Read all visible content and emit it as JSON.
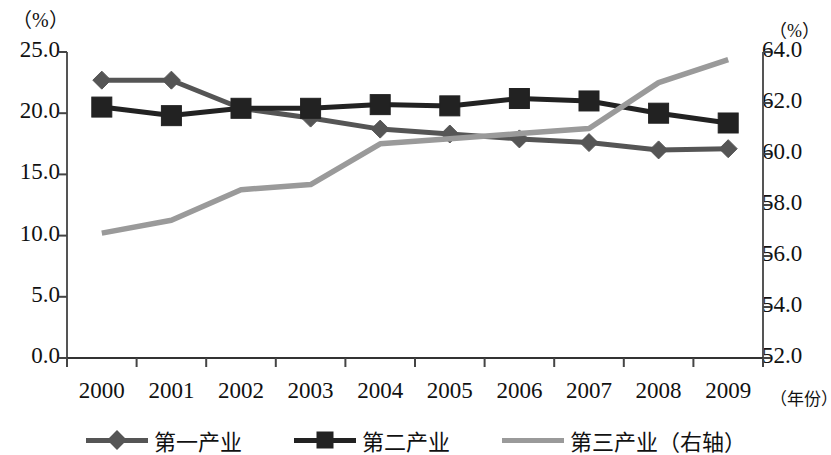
{
  "chart_data": {
    "type": "line",
    "title": "",
    "xlabel": "（年份）",
    "ylabel": "（%）",
    "y2label": "（%）",
    "grid": false,
    "legend_position": "bottom",
    "categories": [
      "2000",
      "2001",
      "2002",
      "2003",
      "2004",
      "2005",
      "2006",
      "2007",
      "2008",
      "2009"
    ],
    "x": [
      2000,
      2001,
      2002,
      2003,
      2004,
      2005,
      2006,
      2007,
      2008,
      2009
    ],
    "ylim": [
      0.0,
      25.0
    ],
    "y_ticks": [
      "0.0",
      "5.0",
      "10.0",
      "15.0",
      "20.0",
      "25.0"
    ],
    "y_tick_values": [
      0.0,
      5.0,
      10.0,
      15.0,
      20.0,
      25.0
    ],
    "y2lim": [
      52.0,
      64.0
    ],
    "y2_ticks": [
      "52.0",
      "54.0",
      "56.0",
      "58.0",
      "60.0",
      "62.0",
      "64.0"
    ],
    "y2_tick_values": [
      52.0,
      54.0,
      56.0,
      58.0,
      60.0,
      62.0,
      64.0
    ],
    "series": [
      {
        "name": "第一产业",
        "axis": "left",
        "marker": "diamond",
        "color": "#555555",
        "values": [
          22.7,
          22.7,
          20.4,
          19.6,
          18.7,
          18.3,
          17.9,
          17.6,
          17.0,
          17.1
        ]
      },
      {
        "name": "第二产业",
        "axis": "left",
        "marker": "square",
        "color": "#222222",
        "values": [
          20.5,
          19.8,
          20.4,
          20.4,
          20.7,
          20.6,
          21.2,
          21.0,
          20.0,
          19.2
        ]
      },
      {
        "name": "第三产业（右轴）",
        "axis": "right",
        "marker": "none",
        "color": "#9a9a9a",
        "values": [
          56.9,
          57.4,
          58.6,
          58.8,
          60.4,
          60.6,
          60.8,
          61.0,
          62.8,
          63.7
        ]
      }
    ]
  },
  "legend": {
    "items": [
      {
        "label": "第一产业"
      },
      {
        "label": "第二产业"
      },
      {
        "label": "第三产业（右轴）"
      }
    ]
  },
  "axes": {
    "left_unit": "（%）",
    "right_unit": "（%）",
    "x_unit": "（年份）"
  }
}
